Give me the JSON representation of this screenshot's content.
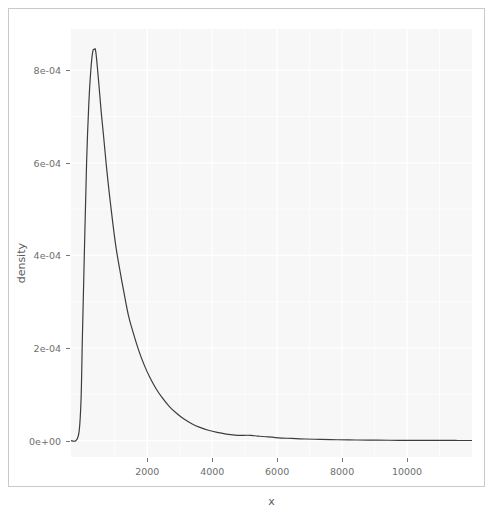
{
  "chart_data": {
    "type": "line",
    "title": "",
    "subtitle": "",
    "xlabel": "x",
    "ylabel": "density",
    "xlim": [
      -350,
      12000
    ],
    "ylim": [
      -3.55e-05,
      0.000889
    ],
    "grid": true,
    "legend": null,
    "x_ticks": [
      2000,
      4000,
      6000,
      8000,
      10000
    ],
    "x_tick_labels": [
      "2000",
      "4000",
      "6000",
      "8000",
      "10000"
    ],
    "y_ticks": [
      0,
      0.0002,
      0.0004,
      0.0006,
      0.0008
    ],
    "y_tick_labels": [
      "0e+00",
      "2e-04",
      "4e-04",
      "6e-04",
      "8e-04"
    ],
    "series": [
      {
        "name": "density",
        "color": "#3d3d3d",
        "x": [
          -350,
          -200,
          -100,
          -40,
          0,
          60,
          130,
          200,
          260,
          320,
          370,
          400,
          430,
          470,
          520,
          580,
          650,
          730,
          820,
          920,
          1030,
          1150,
          1280,
          1420,
          1570,
          1730,
          1900,
          2080,
          2270,
          2470,
          2680,
          2900,
          3130,
          3370,
          3620,
          3880,
          4150,
          4430,
          4700,
          4900,
          5050,
          5200,
          5400,
          5650,
          5950,
          6300,
          6700,
          7150,
          7650,
          8200,
          8800,
          9450,
          10150,
          10900,
          11500,
          12000
        ],
        "y": [
          0.0,
          0.0,
          2e-05,
          9e-05,
          0.00022,
          0.0004,
          0.0006,
          0.00073,
          0.0008,
          0.00084,
          0.000845,
          0.000845,
          0.00083,
          0.0008,
          0.00076,
          0.00071,
          0.00066,
          0.0006,
          0.00054,
          0.00048,
          0.00042,
          0.00037,
          0.00032,
          0.00027,
          0.000232,
          0.000196,
          0.000164,
          0.000136,
          0.000112,
          9.15e-05,
          7.35e-05,
          5.9e-05,
          4.65e-05,
          3.65e-05,
          2.85e-05,
          2.22e-05,
          1.75e-05,
          1.4e-05,
          1.18e-05,
          1.12e-05,
          1.15e-05,
          1.12e-05,
          9.8e-06,
          8.2e-06,
          6.5e-06,
          5e-06,
          3.8e-06,
          2.8e-06,
          2e-06,
          1.4e-06,
          1e-06,
          7e-07,
          5e-07,
          3e-07,
          2e-07,
          1e-07
        ],
        "peak_x": 400,
        "peak_y": 0.000845
      }
    ],
    "panel_background": "#f7f7f7",
    "grid_color": "#ffffff",
    "axis_text_color": "#6e6e6e",
    "axis_title_color": "#5a5a5a",
    "line_color": "#3d3d3d"
  },
  "axes": {
    "x_title": "x",
    "y_title": "density"
  }
}
